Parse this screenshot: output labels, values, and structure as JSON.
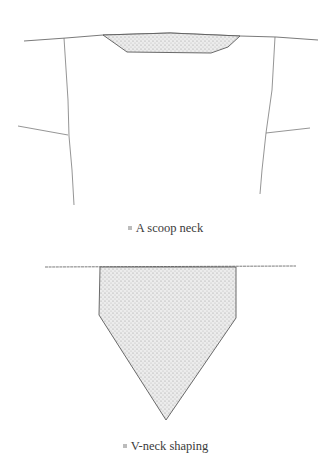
{
  "figures": [
    {
      "id": "scoop",
      "caption": "A scoop neck",
      "bullet_color": "#bcbcbc"
    },
    {
      "id": "vneck",
      "caption": "V-neck shaping",
      "bullet_color": "#bcbcbc"
    }
  ],
  "colors": {
    "line": "#6b6b6b",
    "fill": "#e6e6e6",
    "text": "#3a3a3a"
  }
}
